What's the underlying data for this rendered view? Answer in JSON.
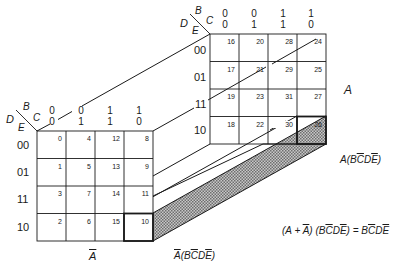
{
  "diagram": {
    "front_map": {
      "name": "A-bar map",
      "variable_label": "Ā",
      "axis": {
        "D": "D",
        "E": "E",
        "B": "B",
        "C": "C"
      },
      "column_headers": [
        {
          "B": "0",
          "C": "0"
        },
        {
          "B": "0",
          "C": "1"
        },
        {
          "B": "1",
          "C": "1"
        },
        {
          "B": "1",
          "C": "0"
        }
      ],
      "row_headers": [
        "00",
        "01",
        "11",
        "10"
      ],
      "cells": [
        [
          "0",
          "4",
          "12",
          "8"
        ],
        [
          "1",
          "5",
          "13",
          "9"
        ],
        [
          "3",
          "7",
          "14",
          "11"
        ],
        [
          "2",
          "6",
          "15",
          "10"
        ]
      ]
    },
    "back_map": {
      "name": "A map",
      "variable_label": "A",
      "axis": {
        "D": "D",
        "E": "E",
        "B": "B",
        "C": "C"
      },
      "column_headers": [
        {
          "B": "0",
          "C": "0"
        },
        {
          "B": "0",
          "C": "1"
        },
        {
          "B": "1",
          "C": "1"
        },
        {
          "B": "1",
          "C": "0"
        }
      ],
      "row_headers": [
        "00",
        "01",
        "11",
        "10"
      ],
      "cells": [
        [
          "16",
          "20",
          "28",
          "24"
        ],
        [
          "17",
          "21",
          "29",
          "25"
        ],
        [
          "19",
          "23",
          "31",
          "27"
        ],
        [
          "18",
          "22",
          "30",
          "26"
        ]
      ]
    },
    "highlighted_cells": [
      "10",
      "26"
    ],
    "annotations": {
      "front_term": {
        "prefix": "Ā",
        "open": "(",
        "B": "B",
        "C": "C",
        "D": "D",
        "E": "E",
        "close": ")"
      },
      "back_term": {
        "prefix": "A",
        "open": "(",
        "B": "B",
        "C": "C",
        "D": "D",
        "E": "E",
        "close": ")"
      },
      "equation_left": "(A + ",
      "equation_abar": "A",
      "equation_mid": ") (B",
      "equation_c": "C",
      "equation_d": "D",
      "equation_e": "E",
      "equation_eq": ") = B",
      "equation_rc": "C",
      "equation_rd": "D",
      "equation_re": "E"
    },
    "colors": {
      "line": "#1a1a1a",
      "shade": "#9a9a9a",
      "background": "#ffffff"
    }
  }
}
